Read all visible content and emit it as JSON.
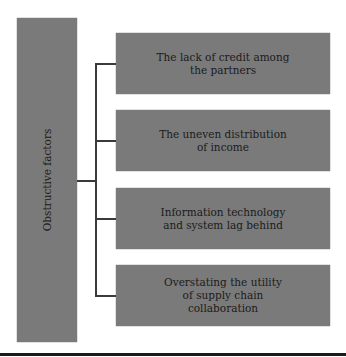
{
  "diagram": {
    "root": {
      "label": "Obstructive factors"
    },
    "children": [
      {
        "label": "The lack of credit among the partners"
      },
      {
        "label": "The uneven distribution of income"
      },
      {
        "label": "Information technology and system lag behind"
      },
      {
        "label": "Overstating the utility of supply chain collaboration"
      }
    ],
    "colors": {
      "box_fill": "#7a7a7a",
      "connector": "#3a3a3a",
      "text": "#1a1a1a"
    }
  }
}
